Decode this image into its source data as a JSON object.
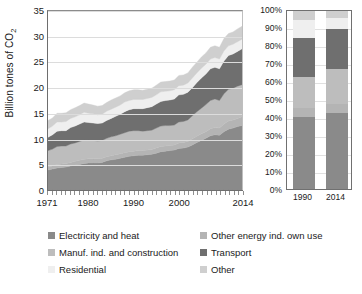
{
  "chart_data": [
    {
      "type": "area",
      "id": "co2-by-sector-absolute",
      "title": "",
      "xlabel": "",
      "ylabel": "Billion tones of CO2",
      "ylabel_display": "Billion tones of CO",
      "ylabel_sub": "2",
      "ylim": [
        0,
        35
      ],
      "yticks": [
        0,
        5,
        10,
        15,
        20,
        25,
        30,
        35
      ],
      "xlim": [
        1971,
        2014
      ],
      "xticks": [
        1971,
        1980,
        1990,
        2000,
        2014
      ],
      "xticklabels": [
        "1971",
        "1980",
        "1990",
        "2000",
        "2014"
      ],
      "grid": true,
      "stacked": true,
      "x": [
        1971,
        1972,
        1973,
        1974,
        1975,
        1976,
        1977,
        1978,
        1979,
        1980,
        1981,
        1982,
        1983,
        1984,
        1985,
        1986,
        1987,
        1988,
        1989,
        1990,
        1991,
        1992,
        1993,
        1994,
        1995,
        1996,
        1997,
        1998,
        1999,
        2000,
        2001,
        2002,
        2003,
        2004,
        2005,
        2006,
        2007,
        2008,
        2009,
        2010,
        2011,
        2012,
        2013,
        2014
      ],
      "series": [
        {
          "name": "Electricity and heat",
          "color": "#8a8a8a",
          "values": [
            3.9,
            4.1,
            4.3,
            4.4,
            4.5,
            4.7,
            4.9,
            5.0,
            5.2,
            5.3,
            5.3,
            5.3,
            5.4,
            5.7,
            5.9,
            6.0,
            6.2,
            6.4,
            6.6,
            6.7,
            6.8,
            6.8,
            6.9,
            7.0,
            7.2,
            7.5,
            7.6,
            7.7,
            7.8,
            8.1,
            8.2,
            8.4,
            8.8,
            9.3,
            9.7,
            10.1,
            10.6,
            10.8,
            10.7,
            11.4,
            11.9,
            12.1,
            12.4,
            12.6
          ]
        },
        {
          "name": "Other energy ind. own use",
          "color": "#b4b4b4",
          "values": [
            0.6,
            0.6,
            0.7,
            0.7,
            0.7,
            0.7,
            0.7,
            0.8,
            0.8,
            0.8,
            0.8,
            0.8,
            0.8,
            0.8,
            0.8,
            0.9,
            0.9,
            0.9,
            0.9,
            0.9,
            0.9,
            0.9,
            0.9,
            0.9,
            1.0,
            1.0,
            1.0,
            1.0,
            1.0,
            1.1,
            1.1,
            1.1,
            1.2,
            1.2,
            1.3,
            1.3,
            1.4,
            1.4,
            1.4,
            1.5,
            1.6,
            1.6,
            1.6,
            1.7
          ]
        },
        {
          "name": "Manuf. ind. and construction",
          "color": "#bdbdbd",
          "values": [
            3.2,
            3.3,
            3.5,
            3.5,
            3.4,
            3.6,
            3.6,
            3.7,
            3.8,
            3.7,
            3.6,
            3.5,
            3.5,
            3.6,
            3.7,
            3.7,
            3.8,
            3.9,
            4.0,
            4.0,
            3.9,
            3.8,
            3.8,
            3.8,
            3.9,
            4.0,
            4.0,
            3.9,
            3.9,
            4.1,
            4.1,
            4.2,
            4.5,
            4.8,
            5.0,
            5.3,
            5.5,
            5.6,
            5.4,
            5.9,
            6.2,
            6.2,
            6.3,
            6.3
          ]
        },
        {
          "name": "Transport",
          "color": "#6f6f6f",
          "values": [
            2.6,
            2.8,
            3.0,
            3.0,
            3.0,
            3.2,
            3.3,
            3.4,
            3.5,
            3.4,
            3.4,
            3.4,
            3.4,
            3.5,
            3.6,
            3.8,
            3.9,
            4.1,
            4.2,
            4.3,
            4.3,
            4.4,
            4.5,
            4.6,
            4.7,
            4.8,
            4.9,
            5.0,
            5.1,
            5.3,
            5.3,
            5.4,
            5.5,
            5.7,
            5.9,
            6.0,
            6.2,
            6.2,
            6.2,
            6.4,
            6.6,
            6.7,
            6.8,
            7.0
          ]
        },
        {
          "name": "Residential",
          "color": "#efefef",
          "values": [
            1.7,
            1.7,
            1.8,
            1.7,
            1.8,
            1.8,
            1.8,
            1.8,
            1.9,
            1.8,
            1.8,
            1.7,
            1.7,
            1.8,
            1.8,
            1.8,
            1.8,
            1.9,
            1.8,
            1.8,
            1.8,
            1.8,
            1.8,
            1.8,
            1.8,
            1.9,
            1.8,
            1.8,
            1.8,
            1.8,
            1.8,
            1.8,
            1.9,
            1.9,
            1.9,
            1.9,
            1.9,
            1.9,
            1.9,
            2.0,
            1.9,
            1.9,
            1.9,
            1.9
          ]
        },
        {
          "name": "Other",
          "color": "#cfcfcf",
          "values": [
            1.6,
            1.6,
            1.7,
            1.7,
            1.7,
            1.7,
            1.8,
            1.8,
            1.8,
            1.8,
            1.7,
            1.7,
            1.7,
            1.7,
            1.8,
            1.8,
            1.8,
            1.8,
            1.9,
            1.9,
            1.9,
            1.8,
            1.8,
            1.8,
            1.9,
            1.9,
            1.9,
            1.9,
            1.9,
            2.0,
            2.0,
            2.0,
            2.1,
            2.1,
            2.2,
            2.2,
            2.3,
            2.3,
            2.3,
            2.4,
            2.4,
            2.4,
            2.5,
            2.5
          ]
        }
      ],
      "totals_note": [
        "1971 total ~13.6",
        "2014 total ~32.0"
      ]
    },
    {
      "type": "bar",
      "id": "co2-by-sector-share",
      "stacked": true,
      "normalized_100pct": true,
      "title": "",
      "xlabel": "",
      "ylabel": "",
      "ylim": [
        0,
        100
      ],
      "yticks": [
        0,
        10,
        20,
        30,
        40,
        50,
        60,
        70,
        80,
        90,
        100
      ],
      "yticklabels": [
        "0%",
        "10%",
        "20%",
        "30%",
        "40%",
        "50%",
        "60%",
        "70%",
        "80%",
        "90%",
        "100%"
      ],
      "categories": [
        "1990",
        "2014"
      ],
      "grid": true,
      "series": [
        {
          "name": "Electricity and heat",
          "color": "#8a8a8a",
          "values": [
            40.0,
            42.0
          ]
        },
        {
          "name": "Other energy ind. own use",
          "color": "#b4b4b4",
          "values": [
            5.0,
            5.5
          ]
        },
        {
          "name": "Manuf. ind. and construction",
          "color": "#bdbdbd",
          "values": [
            17.0,
            19.0
          ]
        },
        {
          "name": "Transport",
          "color": "#6f6f6f",
          "values": [
            22.0,
            22.5
          ]
        },
        {
          "name": "Residential",
          "color": "#efefef",
          "values": [
            10.0,
            6.0
          ]
        },
        {
          "name": "Other",
          "color": "#cfcfcf",
          "values": [
            6.0,
            5.0
          ]
        }
      ]
    }
  ],
  "left_chart": {
    "ylabel_display": "Billion tones of CO",
    "ylabel_sub": "2",
    "yticks": [
      "35",
      "30",
      "25",
      "20",
      "15",
      "10",
      "5",
      "0"
    ],
    "xticklabels": [
      "1971",
      "1980",
      "1990",
      "2000",
      "2014"
    ]
  },
  "right_chart": {
    "yticks": [
      "100%",
      "90%",
      "80%",
      "70%",
      "60%",
      "50%",
      "40%",
      "30%",
      "20%",
      "10%",
      "0%"
    ],
    "xticklabels": [
      "1990",
      "2014"
    ]
  },
  "legend": {
    "left_column": [
      {
        "label": "Electricity and heat",
        "color": "#8a8a8a"
      },
      {
        "label": "Manuf. ind. and construction",
        "color": "#bdbdbd"
      },
      {
        "label": "Residential",
        "color": "#efefef"
      }
    ],
    "right_column": [
      {
        "label": "Other energy ind. own use",
        "color": "#b4b4b4"
      },
      {
        "label": "Transport",
        "color": "#6f6f6f"
      },
      {
        "label": "Other",
        "color": "#cfcfcf"
      }
    ]
  }
}
